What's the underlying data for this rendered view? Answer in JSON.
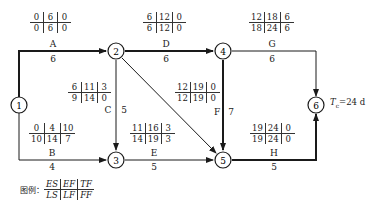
{
  "nodes": [
    {
      "id": "1",
      "label": "1"
    },
    {
      "id": "2",
      "label": "2"
    },
    {
      "id": "3",
      "label": "3"
    },
    {
      "id": "4",
      "label": "4"
    },
    {
      "id": "5",
      "label": "5"
    },
    {
      "id": "6",
      "label": "6"
    }
  ],
  "activities": {
    "A": {
      "name": "A",
      "duration": "6",
      "from": "1",
      "to": "2",
      "critical": true,
      "ES": "0",
      "EF": "6",
      "TF": "0",
      "LS": "0",
      "LF": "6",
      "FF": "0"
    },
    "B": {
      "name": "B",
      "duration": "4",
      "from": "1",
      "to": "3",
      "critical": false,
      "ES": "0",
      "EF": "4",
      "TF": "10",
      "LS": "10",
      "LF": "14",
      "FF": "7"
    },
    "C": {
      "name": "C",
      "duration": "5",
      "from": "2",
      "to": "3",
      "critical": false,
      "ES": "6",
      "EF": "11",
      "TF": "3",
      "LS": "9",
      "LF": "14",
      "FF": "0"
    },
    "D": {
      "name": "D",
      "duration": "6",
      "from": "2",
      "to": "4",
      "critical": true,
      "ES": "6",
      "EF": "12",
      "TF": "0",
      "LS": "6",
      "LF": "12",
      "FF": "0"
    },
    "E": {
      "name": "E",
      "duration": "5",
      "from": "3",
      "to": "5",
      "critical": false,
      "ES": "11",
      "EF": "16",
      "TF": "3",
      "LS": "14",
      "LF": "19",
      "FF": "3"
    },
    "F": {
      "name": "F",
      "duration": "7",
      "from": "4",
      "to": "5",
      "critical": true,
      "ES": "12",
      "EF": "19",
      "TF": "0",
      "LS": "12",
      "LF": "19",
      "FF": "0"
    },
    "G": {
      "name": "G",
      "duration": "6",
      "from": "4",
      "to": "6",
      "critical": false,
      "ES": "12",
      "EF": "18",
      "TF": "6",
      "LS": "18",
      "LF": "24",
      "FF": "6"
    },
    "H": {
      "name": "H",
      "duration": "5",
      "from": "5",
      "to": "6",
      "critical": true,
      "ES": "19",
      "EF": "24",
      "TF": "0",
      "LS": "19",
      "LF": "24",
      "FF": "0"
    }
  },
  "dummy": {
    "from": "2",
    "to": "5"
  },
  "project_duration": {
    "label": "Tc=24 d",
    "symbol": "T",
    "subscript": "c",
    "value": "=24 d"
  },
  "legend": {
    "title": "图例：",
    "top": [
      "ES",
      "EF",
      "TF"
    ],
    "bottom": [
      "LS",
      "LF",
      "FF"
    ]
  }
}
